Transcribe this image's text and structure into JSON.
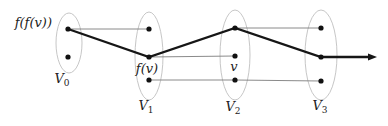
{
  "figure": {
    "background": "#ffffff",
    "width": 388,
    "height": 126,
    "colors": {
      "bold_edge": "#161616",
      "thin_edge": "#7d7d7d",
      "ellipse_stroke": "#bfbfbf",
      "node_fill": "#111111",
      "label": "#222222"
    },
    "sets": [
      {
        "id": "V0",
        "label_main": "V",
        "label_sub": "0",
        "cx": 69,
        "cy": 43,
        "rx": 13,
        "ry": 30,
        "label_x": 62,
        "label_y": 83
      },
      {
        "id": "V1",
        "label_main": "V",
        "label_sub": "1",
        "cx": 149,
        "cy": 56,
        "rx": 14,
        "ry": 44,
        "label_x": 146,
        "label_y": 110
      },
      {
        "id": "V2",
        "label_main": "V",
        "label_sub": "2",
        "cx": 235,
        "cy": 55,
        "rx": 15,
        "ry": 45,
        "label_x": 233,
        "label_y": 111
      },
      {
        "id": "V3",
        "label_main": "V",
        "label_sub": "3",
        "cx": 321,
        "cy": 55,
        "rx": 16,
        "ry": 45,
        "label_x": 320,
        "label_y": 110
      }
    ],
    "nodes": {
      "ffv": [
        68,
        29
      ],
      "v0-lower": [
        68,
        57
      ],
      "v1-top": [
        149,
        29
      ],
      "fv": [
        149,
        57
      ],
      "v1-bottom": [
        149,
        80
      ],
      "v2-top": [
        235,
        28
      ],
      "v": [
        235,
        56
      ],
      "v2-bottom": [
        235,
        80
      ],
      "v3-top": [
        321,
        28
      ],
      "v3-middle": [
        321,
        57
      ],
      "v3-bottom": [
        321,
        81
      ]
    },
    "node_radius": 2.6,
    "node_labels": [
      {
        "id": "label-ffv",
        "text": "f(f(v))",
        "x": 52,
        "y": 27,
        "anchor": "end",
        "size": 13
      },
      {
        "id": "label-fv",
        "text": "f(v)",
        "x": 147,
        "y": 73,
        "anchor": "middle",
        "size": 13
      },
      {
        "id": "label-v",
        "text": "v",
        "x": 234,
        "y": 71,
        "anchor": "middle",
        "size": 13
      }
    ],
    "set_label_size": 13,
    "set_sub_size": 9,
    "thin_edges": [
      [
        "ffv",
        "v1-top"
      ],
      [
        "fv",
        "v"
      ],
      [
        "v1-bottom",
        "v2-bottom"
      ],
      [
        "v2-top",
        "v3-top"
      ],
      [
        "v2-bottom",
        "v3-bottom"
      ]
    ],
    "thin_edge_width": 0.9,
    "ellipse_stroke_width": 0.9,
    "bold_path": {
      "node_ids": [
        "ffv",
        "fv",
        "v2-top",
        "v3-middle"
      ],
      "line_end": [
        369,
        57
      ],
      "arrow_tip": [
        377,
        57
      ],
      "arrow_back_x": 368,
      "arrow_half_width": 3.6,
      "width": 2.3
    }
  }
}
